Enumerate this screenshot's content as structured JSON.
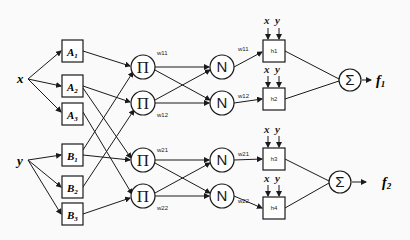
{
  "inputs": {
    "x": "x",
    "y": "y"
  },
  "layer1": {
    "A": [
      {
        "main": "A",
        "sub": "1"
      },
      {
        "main": "A",
        "sub": "2"
      },
      {
        "main": "A",
        "sub": "3"
      }
    ],
    "B": [
      {
        "main": "B",
        "sub": "1"
      },
      {
        "main": "B",
        "sub": "2"
      },
      {
        "main": "B",
        "sub": "3"
      }
    ]
  },
  "layer2": {
    "symbol": "Π",
    "weights": [
      "w11",
      "w12",
      "w21",
      "w22"
    ]
  },
  "layer3": {
    "symbol": "N",
    "weights": [
      "w11",
      "w12",
      "w21",
      "w22"
    ]
  },
  "layer4": {
    "nodes": [
      "h1",
      "h2",
      "h3",
      "h4"
    ],
    "inputs_x": "x",
    "inputs_y": "y"
  },
  "layer5": {
    "symbol": "Σ"
  },
  "outputs": [
    {
      "main": "f",
      "sub": "1"
    },
    {
      "main": "f",
      "sub": "2"
    }
  ],
  "colors": {
    "stroke": "#1a1a1a",
    "background": "#fafafa"
  }
}
